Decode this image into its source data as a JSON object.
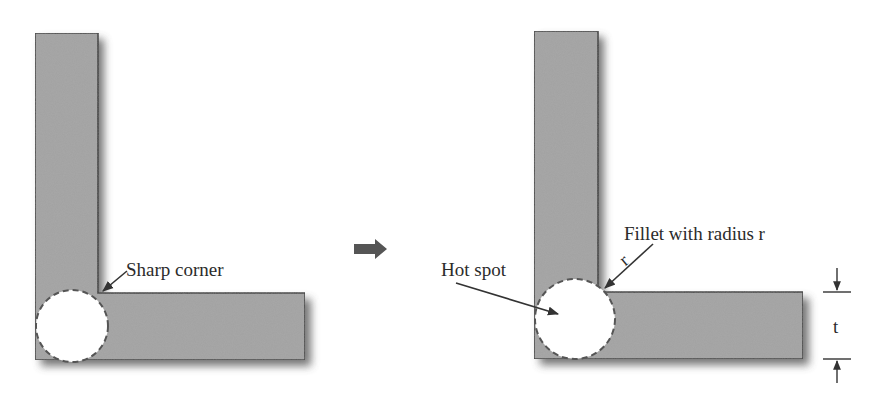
{
  "diagram": {
    "colors": {
      "part_fill": "#a3a3a3",
      "part_outline": "#3a3a3a",
      "shadow": "#4a4a4a",
      "hotspot_fill": "#ffffff",
      "text": "#2b2b2b",
      "transition_arrow": "#555555"
    },
    "left_panel": {
      "name": "sharp-corner-design",
      "corner_label": "Sharp corner",
      "hotspot_shape": "dashed circle at outer corner"
    },
    "transition": {
      "icon": "right-arrow-icon"
    },
    "right_panel": {
      "name": "filleted-corner-design",
      "fillet_label": "Fillet with radius r",
      "radius_symbol": "r",
      "hotspot_label": "Hot spot",
      "thickness_symbol": "t"
    }
  }
}
